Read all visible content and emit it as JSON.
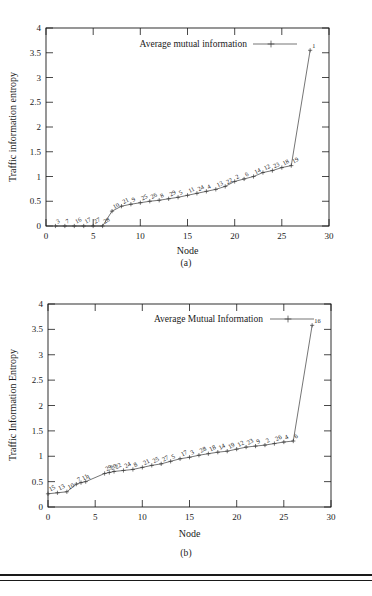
{
  "figure": {
    "panels": [
      {
        "id": "a",
        "caption": "(a)",
        "legend_label": "Average mutual information",
        "ylabel": "Traffic information entropy",
        "xlabel": "Node"
      },
      {
        "id": "b",
        "caption": "(b)",
        "legend_label": "Average Mutual Information",
        "ylabel": "Traffic Information Entropy",
        "xlabel": "Node"
      }
    ]
  },
  "chart_data": [
    {
      "type": "line",
      "panel": "a",
      "title": "",
      "legend": [
        "Average mutual information"
      ],
      "legend_position": "top-center",
      "xlabel": "Node",
      "ylabel": "Traffic information entropy",
      "xlim": [
        0,
        30
      ],
      "ylim": [
        0,
        4
      ],
      "xticks": [
        0,
        5,
        10,
        15,
        20,
        25,
        30
      ],
      "yticks": [
        0,
        0.5,
        1,
        1.5,
        2,
        2.5,
        3,
        3.5,
        4
      ],
      "grid": false,
      "marker": "plus",
      "point_labels": [
        "3",
        "7",
        "16",
        "17",
        "27",
        "28",
        "10",
        "21",
        "9",
        "25",
        "26",
        "8",
        "29",
        "5",
        "11",
        "24",
        "4",
        "13",
        "22",
        "2",
        "6",
        "14",
        "12",
        "23",
        "18",
        "19",
        "1"
      ],
      "x": [
        1,
        2,
        3,
        4,
        5,
        6,
        7,
        8,
        9,
        10,
        11,
        12,
        13,
        14,
        15,
        16,
        17,
        18,
        19,
        20,
        21,
        22,
        23,
        24,
        25,
        26,
        28
      ],
      "y": [
        0,
        0,
        0,
        0,
        0,
        0,
        0.3,
        0.4,
        0.44,
        0.47,
        0.5,
        0.52,
        0.55,
        0.58,
        0.62,
        0.66,
        0.7,
        0.74,
        0.8,
        0.9,
        0.95,
        1.0,
        1.08,
        1.12,
        1.18,
        1.22,
        3.55
      ]
    },
    {
      "type": "line",
      "panel": "b",
      "title": "",
      "legend": [
        "Average Mutual Information"
      ],
      "legend_position": "top-center",
      "xlabel": "Node",
      "ylabel": "Traffic Information Entropy",
      "xlim": [
        0,
        30
      ],
      "ylim": [
        0,
        4
      ],
      "xticks": [
        0,
        5,
        10,
        15,
        20,
        25,
        30
      ],
      "yticks": [
        0,
        0.5,
        1,
        1.5,
        2,
        2.5,
        3,
        3.5,
        4
      ],
      "grid": false,
      "marker": "plus",
      "point_labels": [
        "15",
        "13",
        "10",
        "7",
        "11",
        "1",
        "29",
        "20",
        "22",
        "24",
        "8",
        "21",
        "25",
        "27",
        "5",
        "17",
        "3",
        "28",
        "18",
        "14",
        "19",
        "12",
        "23",
        "9",
        "2",
        "26",
        "4",
        "6",
        "16"
      ],
      "x": [
        0,
        1,
        2,
        3,
        3.5,
        4,
        6,
        6.5,
        7,
        8,
        9,
        10,
        11,
        12,
        13,
        14,
        15,
        16,
        17,
        18,
        19,
        20,
        21,
        22,
        23,
        24,
        25,
        26,
        28
      ],
      "y": [
        0.26,
        0.28,
        0.3,
        0.45,
        0.48,
        0.5,
        0.66,
        0.68,
        0.7,
        0.72,
        0.74,
        0.78,
        0.82,
        0.85,
        0.9,
        0.95,
        0.98,
        1.02,
        1.05,
        1.08,
        1.1,
        1.14,
        1.18,
        1.2,
        1.22,
        1.25,
        1.28,
        1.3,
        3.58
      ]
    }
  ]
}
